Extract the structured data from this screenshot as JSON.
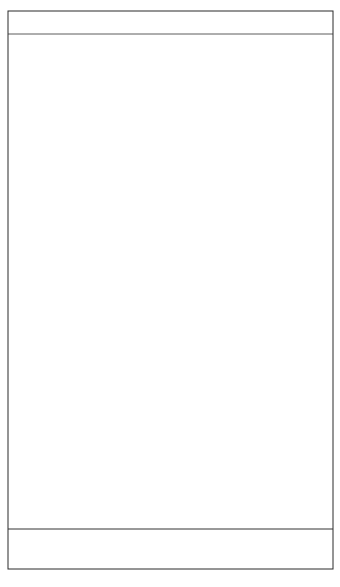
{
  "chart_data": {
    "type": "line",
    "title": "",
    "xlabel": "",
    "ylabel": "",
    "xlim": [
      518,
      797
    ],
    "x_ticks": [
      550,
      600,
      650,
      700,
      750
    ],
    "x_tick_labels": [
      "550",
      "600",
      "650",
      "700",
      "750"
    ],
    "grid": false,
    "legend": null,
    "annotations": [
      {
        "text": "A",
        "subscript": "g",
        "x_nm": 638,
        "note": "label above A_g component peak"
      },
      {
        "text": "B",
        "subscript": "3g",
        "x_nm": 611,
        "note": "label above B_3g component peak"
      }
    ],
    "panels": {
      "residual": {
        "description": "Residual (difference) trace near zero line at top of frame",
        "zero_level": 0
      },
      "envelope": {
        "description": "Observed overall band envelope (arbitrary intensity units, baseline = 0)",
        "points": [
          [
            518,
            20
          ],
          [
            530,
            22
          ],
          [
            545,
            32
          ],
          [
            550,
            34
          ],
          [
            558,
            34
          ],
          [
            565,
            40
          ],
          [
            575,
            46
          ],
          [
            585,
            60
          ],
          [
            592,
            85
          ],
          [
            598,
            140
          ],
          [
            603,
            220
          ],
          [
            606,
            280
          ],
          [
            609,
            290
          ],
          [
            612,
            292
          ],
          [
            616,
            298
          ],
          [
            622,
            340
          ],
          [
            628,
            410
          ],
          [
            632,
            455
          ],
          [
            635,
            466
          ],
          [
            638,
            460
          ],
          [
            641,
            420
          ],
          [
            646,
            330
          ],
          [
            652,
            230
          ],
          [
            658,
            170
          ],
          [
            663,
            145
          ],
          [
            667,
            142
          ],
          [
            672,
            160
          ],
          [
            680,
            230
          ],
          [
            688,
            278
          ],
          [
            694,
            294
          ],
          [
            700,
            285
          ],
          [
            706,
            250
          ],
          [
            712,
            195
          ],
          [
            718,
            150
          ],
          [
            724,
            120
          ],
          [
            730,
            100
          ],
          [
            738,
            70
          ],
          [
            748,
            52
          ],
          [
            760,
            40
          ],
          [
            775,
            33
          ],
          [
            790,
            30
          ],
          [
            797,
            29
          ]
        ]
      },
      "components": [
        {
          "name": "B3g",
          "center_nm": 611,
          "height": 84,
          "width_nm": 14
        },
        {
          "name": "comp-617",
          "center_nm": 617,
          "height": 52,
          "width_nm": 14
        },
        {
          "name": "comp-623",
          "center_nm": 623,
          "height": 80,
          "width_nm": 14
        },
        {
          "name": "comp-634",
          "center_nm": 634,
          "height": 90,
          "width_nm": 14
        },
        {
          "name": "Ag",
          "center_nm": 638,
          "height": 157,
          "width_nm": 14
        },
        {
          "name": "comp-647",
          "center_nm": 647,
          "height": 143,
          "width_nm": 16
        },
        {
          "name": "comp-684",
          "center_nm": 684,
          "height": 40,
          "width_nm": 18
        },
        {
          "name": "comp-695",
          "center_nm": 695,
          "height": 127,
          "width_nm": 18
        },
        {
          "name": "comp-705",
          "center_nm": 705,
          "height": 76,
          "width_nm": 18
        }
      ],
      "minor_band": {
        "center_nm": 550,
        "height": 15,
        "width_nm": 30,
        "note": "small band drawn below baseline region, near axis"
      }
    }
  },
  "colors": {
    "line": "#1a1a1a",
    "frame": "#2a2a2a",
    "background": "#ffffff"
  }
}
